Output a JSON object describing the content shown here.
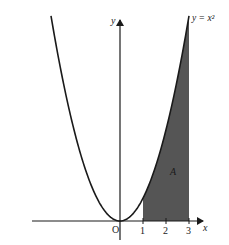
{
  "chart_data": {
    "type": "area",
    "title": "",
    "function": "y = x^2",
    "curve_label": "y = x²",
    "xlabel": "x",
    "ylabel": "y",
    "origin_label": "O",
    "x_ticks": [
      1,
      2,
      3
    ],
    "x_tick_labels": [
      "1",
      "2",
      "3"
    ],
    "xlim": [
      -3,
      3.5
    ],
    "ylim": [
      0,
      9
    ],
    "shaded_region": {
      "label": "A",
      "from_x": 1,
      "to_x": 3,
      "description": "Area under y = x^2 between x = 1 and x = 3"
    },
    "x": [
      -3,
      -2.5,
      -2,
      -1.5,
      -1,
      -0.5,
      0,
      0.5,
      1,
      1.5,
      2,
      2.5,
      3
    ],
    "series": [
      {
        "name": "y = x^2",
        "values": [
          9,
          6.25,
          4,
          2.25,
          1,
          0.25,
          0,
          0.25,
          1,
          2.25,
          4,
          6.25,
          9
        ]
      }
    ],
    "grid": false,
    "legend": "none",
    "colors": {
      "curve": "#1a1a1a",
      "shade": "#555555",
      "axis": "#1a1a1a"
    }
  }
}
